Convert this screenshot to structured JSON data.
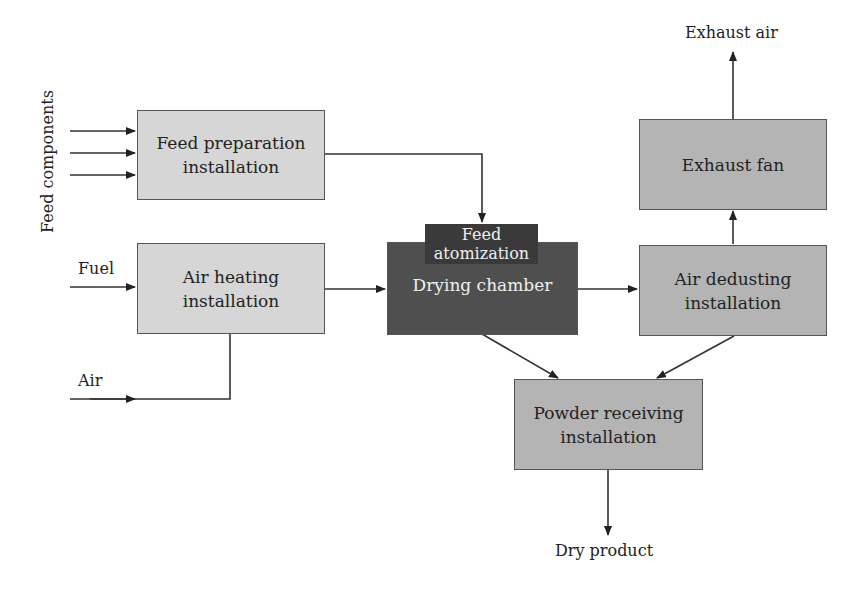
{
  "diagram": {
    "type": "process-flow",
    "nodes": {
      "feed_preparation": "Feed preparation\ninstallation",
      "air_heating": "Air heating\ninstallation",
      "drying_chamber": "Drying chamber",
      "feed_atomization": "Feed\natomization",
      "air_dedusting": "Air dedusting\ninstallation",
      "exhaust_fan": "Exhaust fan",
      "powder_receiving": "Powder receiving\ninstallation"
    },
    "labels": {
      "feed_components": "Feed components",
      "fuel": "Fuel",
      "air": "Air",
      "exhaust_air": "Exhaust air",
      "dry_product": "Dry product"
    },
    "edges": [
      {
        "from": "Feed components",
        "to": "Feed preparation installation"
      },
      {
        "from": "Feed preparation installation",
        "to": "Feed atomization"
      },
      {
        "from": "Fuel",
        "to": "Air heating installation"
      },
      {
        "from": "Air",
        "to": "Air heating installation"
      },
      {
        "from": "Air heating installation",
        "to": "Drying chamber"
      },
      {
        "from": "Drying chamber",
        "to": "Air dedusting installation"
      },
      {
        "from": "Drying chamber",
        "to": "Powder receiving installation"
      },
      {
        "from": "Air dedusting installation",
        "to": "Powder receiving installation"
      },
      {
        "from": "Air dedusting installation",
        "to": "Exhaust fan"
      },
      {
        "from": "Exhaust fan",
        "to": "Exhaust air"
      },
      {
        "from": "Powder receiving installation",
        "to": "Dry product"
      }
    ]
  }
}
